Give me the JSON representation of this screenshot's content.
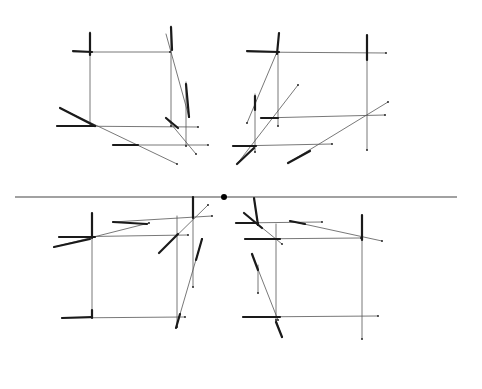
{
  "figure": {
    "width": 482,
    "height": 389,
    "background": "#ffffff",
    "ink": "#1a1a1a",
    "light_ink": "#555555"
  },
  "horizon": {
    "x1": 15,
    "y1": 197,
    "x2": 457,
    "y2": 197,
    "color": "#444444"
  },
  "vanishing_point": {
    "cx": 224,
    "cy": 197,
    "r": 3,
    "color": "#000000"
  },
  "quadrants": [
    {
      "name": "top-left-square",
      "thin": [
        [
          90,
          32,
          90,
          126
        ],
        [
          73,
          52,
          170,
          52
        ],
        [
          171,
          26,
          171,
          126
        ],
        [
          166,
          34,
          189,
          117
        ],
        [
          186,
          82,
          186,
          146
        ],
        [
          57,
          126,
          198,
          127
        ],
        [
          60,
          108,
          177,
          164
        ],
        [
          166,
          118,
          196,
          154
        ],
        [
          113,
          145,
          208,
          145
        ]
      ],
      "thick": [
        [
          73,
          51,
          92,
          52
        ],
        [
          90,
          33,
          90,
          55
        ],
        [
          60,
          108,
          95,
          126
        ],
        [
          57,
          126,
          95,
          126
        ],
        [
          186,
          84,
          189,
          117
        ],
        [
          166,
          118,
          178,
          128
        ],
        [
          113,
          145,
          138,
          145
        ],
        [
          171,
          27,
          172,
          50
        ]
      ]
    },
    {
      "name": "top-right-square",
      "thin": [
        [
          247,
          52,
          386,
          53
        ],
        [
          278,
          52,
          278,
          126
        ],
        [
          367,
          35,
          367,
          150
        ],
        [
          277,
          52,
          247,
          123
        ],
        [
          255,
          94,
          255,
          152
        ],
        [
          237,
          164,
          298,
          85
        ],
        [
          261,
          118,
          385,
          115
        ],
        [
          233,
          146,
          332,
          144
        ],
        [
          288,
          163,
          388,
          102
        ]
      ],
      "thick": [
        [
          247,
          51,
          279,
          52
        ],
        [
          279,
          33,
          277,
          54
        ],
        [
          261,
          118,
          278,
          118
        ],
        [
          233,
          146,
          256,
          146
        ],
        [
          288,
          163,
          310,
          151
        ],
        [
          367,
          35,
          367,
          60
        ],
        [
          255,
          96,
          255,
          110
        ],
        [
          237,
          164,
          254,
          148
        ]
      ]
    },
    {
      "name": "bottom-left-square",
      "thin": [
        [
          92,
          213,
          92,
          317
        ],
        [
          59,
          237,
          188,
          235
        ],
        [
          54,
          247,
          149,
          223
        ],
        [
          113,
          222,
          212,
          216
        ],
        [
          177,
          216,
          177,
          327
        ],
        [
          193,
          197,
          193,
          287
        ],
        [
          159,
          253,
          208,
          205
        ],
        [
          62,
          318,
          185,
          317
        ],
        [
          176,
          328,
          202,
          239
        ]
      ],
      "thick": [
        [
          92,
          213,
          92,
          238
        ],
        [
          59,
          237,
          95,
          237
        ],
        [
          54,
          247,
          90,
          239
        ],
        [
          113,
          222,
          147,
          224
        ],
        [
          159,
          253,
          178,
          234
        ],
        [
          193,
          197,
          193,
          218
        ],
        [
          62,
          318,
          92,
          317
        ],
        [
          92,
          310,
          92,
          318
        ],
        [
          176,
          328,
          180,
          314
        ],
        [
          196,
          260,
          202,
          239
        ]
      ]
    },
    {
      "name": "bottom-right-square",
      "thin": [
        [
          254,
          198,
          258,
          225
        ],
        [
          244,
          213,
          282,
          244
        ],
        [
          236,
          223,
          322,
          222
        ],
        [
          290,
          221,
          382,
          241
        ],
        [
          276,
          224,
          276,
          320
        ],
        [
          245,
          239,
          361,
          238
        ],
        [
          362,
          215,
          362,
          339
        ],
        [
          252,
          254,
          278,
          320
        ],
        [
          276,
          320,
          282,
          337
        ],
        [
          258,
          265,
          258,
          293
        ],
        [
          243,
          317,
          378,
          316
        ]
      ],
      "thick": [
        [
          254,
          198,
          258,
          225
        ],
        [
          244,
          213,
          262,
          228
        ],
        [
          236,
          223,
          258,
          223
        ],
        [
          290,
          221,
          305,
          224
        ],
        [
          245,
          239,
          280,
          239
        ],
        [
          362,
          215,
          362,
          240
        ],
        [
          252,
          254,
          258,
          270
        ],
        [
          243,
          317,
          280,
          317
        ],
        [
          276,
          322,
          282,
          337
        ]
      ]
    }
  ]
}
